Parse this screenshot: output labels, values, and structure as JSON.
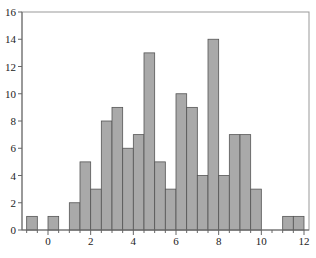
{
  "chart_data": {
    "type": "bar",
    "title": "",
    "xlabel": "",
    "ylabel": "",
    "bin_width": 0.5,
    "bins": [
      {
        "start": -1.0,
        "end": -0.5,
        "count": 1
      },
      {
        "start": -0.5,
        "end": 0.0,
        "count": 0
      },
      {
        "start": 0.0,
        "end": 0.5,
        "count": 1
      },
      {
        "start": 0.5,
        "end": 1.0,
        "count": 0
      },
      {
        "start": 1.0,
        "end": 1.5,
        "count": 2
      },
      {
        "start": 1.5,
        "end": 2.0,
        "count": 5
      },
      {
        "start": 2.0,
        "end": 2.5,
        "count": 3
      },
      {
        "start": 2.5,
        "end": 3.0,
        "count": 8
      },
      {
        "start": 3.0,
        "end": 3.5,
        "count": 9
      },
      {
        "start": 3.5,
        "end": 4.0,
        "count": 6
      },
      {
        "start": 4.0,
        "end": 4.5,
        "count": 7
      },
      {
        "start": 4.5,
        "end": 5.0,
        "count": 13
      },
      {
        "start": 5.0,
        "end": 5.5,
        "count": 5
      },
      {
        "start": 5.5,
        "end": 6.0,
        "count": 3
      },
      {
        "start": 6.0,
        "end": 6.5,
        "count": 10
      },
      {
        "start": 6.5,
        "end": 7.0,
        "count": 9
      },
      {
        "start": 7.0,
        "end": 7.5,
        "count": 4
      },
      {
        "start": 7.5,
        "end": 8.0,
        "count": 14
      },
      {
        "start": 8.0,
        "end": 8.5,
        "count": 4
      },
      {
        "start": 8.5,
        "end": 9.0,
        "count": 7
      },
      {
        "start": 9.0,
        "end": 9.5,
        "count": 7
      },
      {
        "start": 9.5,
        "end": 10.0,
        "count": 3
      },
      {
        "start": 10.0,
        "end": 10.5,
        "count": 0
      },
      {
        "start": 10.5,
        "end": 11.0,
        "count": 0
      },
      {
        "start": 11.0,
        "end": 11.5,
        "count": 1
      },
      {
        "start": 11.5,
        "end": 12.0,
        "count": 1
      }
    ],
    "xlim": [
      -1.2,
      12.2
    ],
    "ylim": [
      0,
      16
    ],
    "xticks": [
      0,
      2,
      4,
      6,
      8,
      10,
      12
    ],
    "yticks": [
      0,
      2,
      4,
      6,
      8,
      10,
      12,
      14,
      16
    ],
    "grid": false,
    "legend": null,
    "colors": {
      "bar_fill": "#a9a9a9",
      "bar_edge": "#555555",
      "axis": "#888888"
    }
  }
}
